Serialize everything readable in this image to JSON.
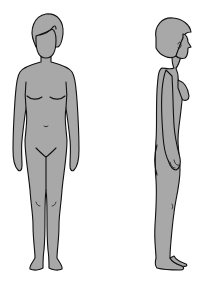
{
  "illustration": {
    "description": "Line drawing of a female body in front view and side (profile) view",
    "fill_color": "#a8a8a8",
    "stroke_color": "#111111",
    "background": "#ffffff",
    "figures": [
      {
        "view": "front"
      },
      {
        "view": "side"
      }
    ]
  }
}
